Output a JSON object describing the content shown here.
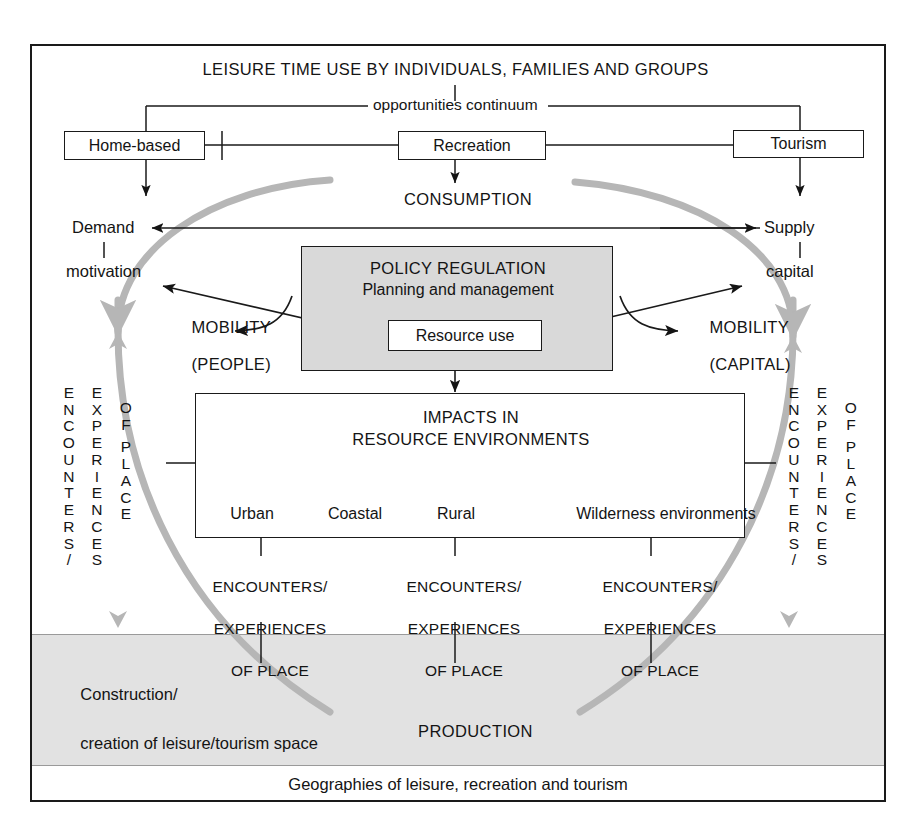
{
  "diagram": {
    "title": "LEISURE TIME USE BY INDIVIDUALS, FAMILIES AND GROUPS",
    "continuum_label": "opportunities continuum",
    "continuum_boxes": [
      {
        "label": "Home-based"
      },
      {
        "label": "Recreation"
      },
      {
        "label": "Tourism"
      }
    ],
    "consumption_label": "CONSUMPTION",
    "production_label": "PRODUCTION",
    "demand": {
      "label": "Demand",
      "sub": "motivation"
    },
    "supply": {
      "label": "Supply",
      "sub": "capital"
    },
    "policy": {
      "title": "POLICY REGULATION",
      "subtitle": "Planning and management",
      "inner_box": "Resource use"
    },
    "mobility_people": {
      "line1": "MOBILITY",
      "line2": "(PEOPLE)"
    },
    "mobility_capital": {
      "line1": "MOBILITY",
      "line2": "(CAPITAL)"
    },
    "impacts": {
      "line1": "IMPACTS IN",
      "line2": "RESOURCE ENVIRONMENTS",
      "environments": [
        "Urban",
        "Coastal",
        "Rural",
        "Wilderness environments"
      ]
    },
    "encounters_blocks": [
      {
        "line1": "ENCOUNTERS/",
        "line2": "EXPERIENCES",
        "line3": "OF PLACE"
      },
      {
        "line1": "ENCOUNTERS/",
        "line2": "EXPERIENCES",
        "line3": "OF PLACE"
      },
      {
        "line1": "ENCOUNTERS/",
        "line2": "EXPERIENCES",
        "line3": "OF PLACE"
      }
    ],
    "vertical_columns": {
      "left": [
        {
          "text": "ENCOUNTERS/"
        },
        {
          "text": "EXPERIENCES"
        },
        {
          "text": "OF PLACE"
        }
      ],
      "right": [
        {
          "text": "ENCOUNTERS/"
        },
        {
          "text": "EXPERIENCES"
        },
        {
          "text": "OF PLACE"
        }
      ]
    },
    "construction": {
      "line1": "Construction/",
      "line2": "creation of leisure/tourism space"
    },
    "footer_label": "Geographies of leisure, recreation and tourism",
    "colors": {
      "ink": "#141414",
      "policy_fill": "#d9d9d9",
      "band_fill": "#e2e2e2",
      "swoosh": "#b6b6b6"
    }
  }
}
